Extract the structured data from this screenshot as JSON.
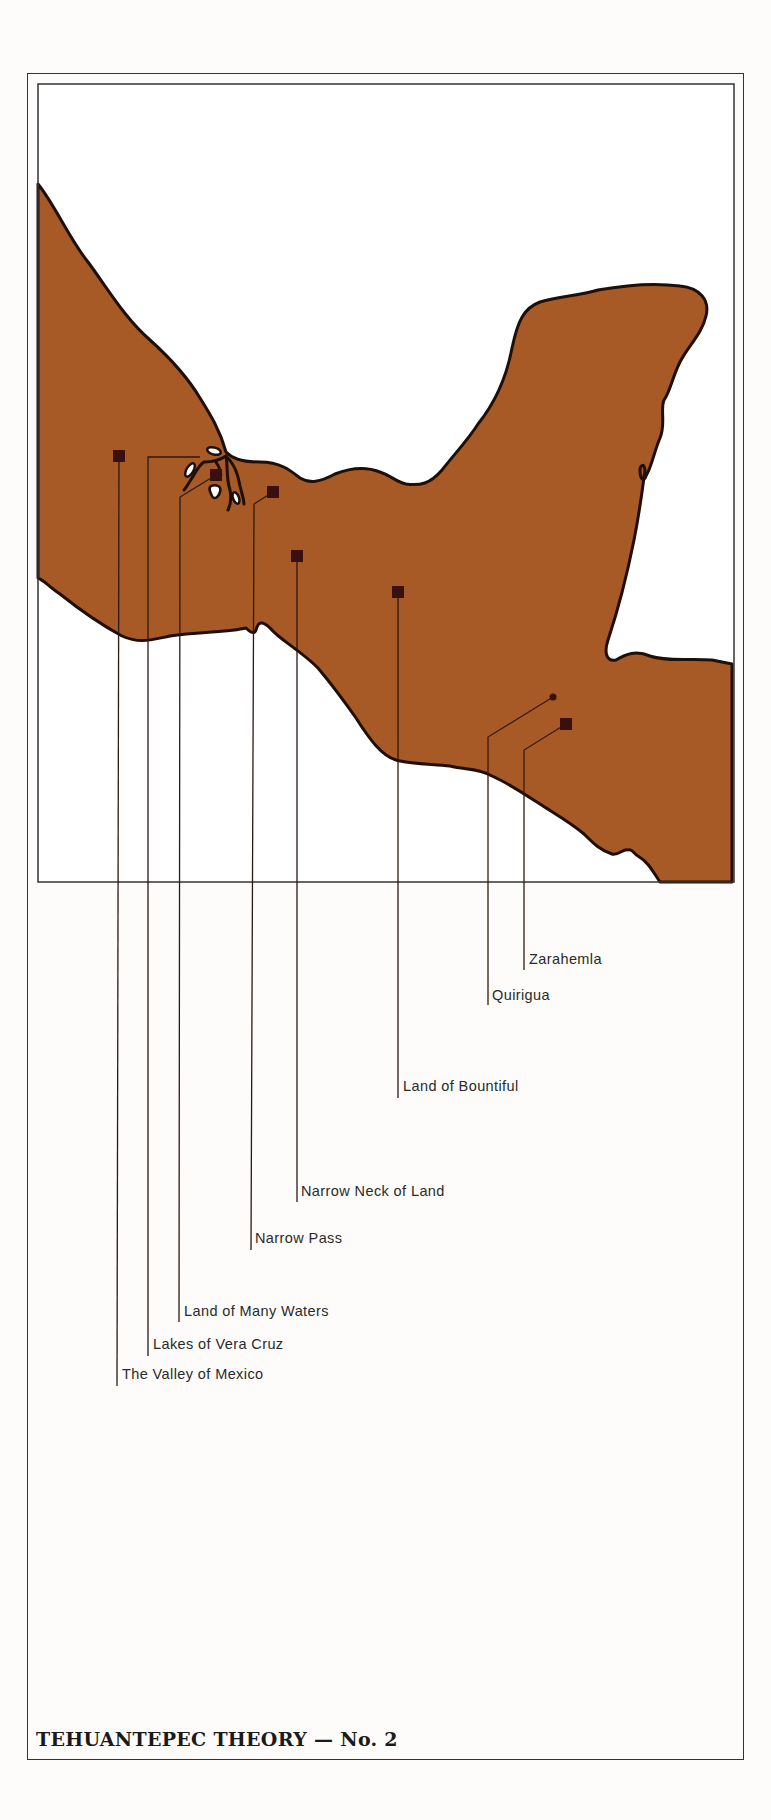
{
  "colors": {
    "land": "#a85a26",
    "coastline": "#1e0f08",
    "marker": "#3a0f0f",
    "leader_line": "#222222",
    "paper": "#fdfcfa",
    "water": "#ffffff"
  },
  "map": {
    "title": "TEHUANTEPEC THEORY — No. 2",
    "locations": [
      {
        "id": "zarahemla",
        "label": "Zarahemla",
        "marker": "square",
        "marker_x": 566,
        "marker_y": 724,
        "label_x": 529,
        "label_y": 959
      },
      {
        "id": "quirigua",
        "label": "Quirigua",
        "marker": "dot",
        "marker_x": 553,
        "marker_y": 697,
        "label_x": 492,
        "label_y": 995
      },
      {
        "id": "bountiful",
        "label": "Land of Bountiful",
        "marker": "square",
        "marker_x": 398,
        "marker_y": 592,
        "label_x": 403,
        "label_y": 1086
      },
      {
        "id": "narrow-neck",
        "label": "Narrow Neck of Land",
        "marker": "square",
        "marker_x": 297,
        "marker_y": 556,
        "label_x": 301,
        "label_y": 1191
      },
      {
        "id": "narrow-pass",
        "label": "Narrow Pass",
        "marker": "square",
        "marker_x": 273,
        "marker_y": 492,
        "label_x": 255,
        "label_y": 1238
      },
      {
        "id": "many-waters",
        "label": "Land of Many Waters",
        "marker": "square",
        "marker_x": 216,
        "marker_y": 475,
        "label_x": 184,
        "label_y": 1311
      },
      {
        "id": "vera-cruz",
        "label": "Lakes of Vera Cruz",
        "marker": "none",
        "marker_x": 200,
        "marker_y": 457,
        "label_x": 153,
        "label_y": 1344
      },
      {
        "id": "valley-mexico",
        "label": "The Valley of Mexico",
        "marker": "square",
        "marker_x": 119,
        "marker_y": 456,
        "label_x": 122,
        "label_y": 1374
      }
    ]
  }
}
